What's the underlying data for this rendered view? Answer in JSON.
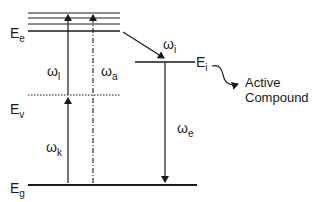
{
  "diagram": {
    "type": "energy-level diagram",
    "levels": {
      "excited": {
        "label": "E",
        "sub": "e"
      },
      "virtual": {
        "label": "E",
        "sub": "v"
      },
      "ground": {
        "label": "E",
        "sub": "g"
      },
      "intermediate": {
        "label": "E",
        "sub": "i"
      }
    },
    "transitions": {
      "laser": {
        "label": "ω",
        "sub": "l"
      },
      "absorption": {
        "label": "ω",
        "sub": "a"
      },
      "pump": {
        "label": "ω",
        "sub": "k"
      },
      "intersystem": {
        "label": "ω",
        "sub": "i"
      },
      "emission": {
        "label": "ω",
        "sub": "e"
      }
    },
    "annotation": {
      "line1": "Active",
      "line2": "Compound"
    },
    "colors": {
      "line": "#1a1a1a",
      "background": "#ffffff"
    }
  }
}
